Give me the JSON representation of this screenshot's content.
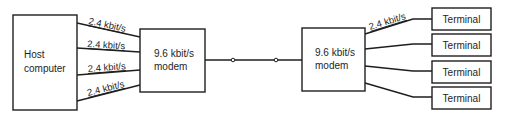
{
  "diagram": {
    "host": {
      "line1": "Host",
      "line2": "computer"
    },
    "left_modem": {
      "line1": "9.6 kbit/s",
      "line2": "modem"
    },
    "right_modem": {
      "line1": "9.6 kbit/s",
      "line2": "modem"
    },
    "host_links": [
      {
        "rate": "2.4 kbit/s"
      },
      {
        "rate": "2.4 kbit/s"
      },
      {
        "rate": "2.4 kbit/s"
      },
      {
        "rate": "2.4 kbit/s"
      }
    ],
    "terminal_links": [
      {
        "rate": "2.4 kbit/s"
      }
    ],
    "terminals": [
      {
        "label": "Terminal"
      },
      {
        "label": "Terminal"
      },
      {
        "label": "Terminal"
      },
      {
        "label": "Terminal"
      }
    ],
    "colors": {
      "ink": "#1e1e1e",
      "background": "#ffffff"
    }
  }
}
